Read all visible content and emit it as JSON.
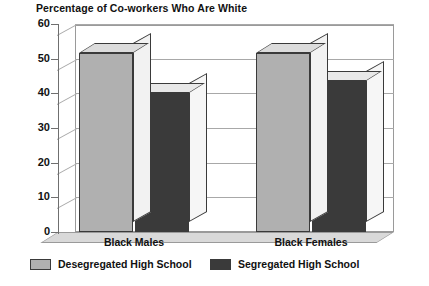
{
  "chart_data": {
    "type": "bar",
    "title": "Percentage of Co-workers Who Are White",
    "xlabel": "",
    "ylabel": "",
    "ylim": [
      0,
      60
    ],
    "yticks": [
      0,
      10,
      20,
      30,
      40,
      50,
      60
    ],
    "grid": true,
    "legend_position": "bottom",
    "categories": [
      "Black Males",
      "Black Females"
    ],
    "series": [
      {
        "name": "Desegregated High School",
        "color": "#b0b0b0",
        "values": [
          51.5,
          51.5
        ]
      },
      {
        "name": "Segregated High School",
        "color": "#3a3a3a",
        "values": [
          40,
          43.5
        ]
      }
    ]
  }
}
